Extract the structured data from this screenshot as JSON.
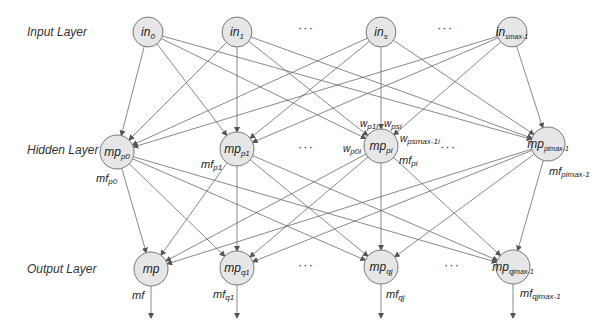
{
  "diagram": {
    "type": "neural-network",
    "colors": {
      "node_fill": "#e6e6e6",
      "node_stroke": "#777777",
      "edge": "#666666",
      "text": "#222222"
    },
    "layers": [
      {
        "label": "Input Layer",
        "y": 32
      },
      {
        "label": "Hidden Layer",
        "y": 148
      },
      {
        "label": "Output Layer",
        "y": 268
      }
    ],
    "ellipsis": "···",
    "input_nodes": [
      {
        "id": "in0",
        "base": "in",
        "sub": "0",
        "x": 148,
        "y": 32
      },
      {
        "id": "in1",
        "base": "in",
        "sub": "1",
        "x": 237,
        "y": 32
      },
      {
        "id": "ins",
        "base": "in",
        "sub": "s",
        "x": 381,
        "y": 32
      },
      {
        "id": "insmax",
        "base": "in",
        "sub": "smax-1",
        "x": 512,
        "y": 32
      }
    ],
    "hidden_nodes": [
      {
        "id": "mpp0",
        "base": "mp",
        "sub": "p0",
        "x": 117,
        "y": 152,
        "out_label": "mf",
        "out_sub": "p0"
      },
      {
        "id": "mpp1",
        "base": "mp",
        "sub": "p1",
        "x": 237,
        "y": 149,
        "out_label": "mf",
        "out_sub": "p1"
      },
      {
        "id": "mppi",
        "base": "mp",
        "sub": "pi",
        "x": 381,
        "y": 146,
        "out_label": "mf",
        "out_sub": "pi"
      },
      {
        "id": "mppimax",
        "base": "mp",
        "sub": "pimax-1",
        "x": 548,
        "y": 144,
        "out_label": "mf",
        "out_sub": "pimax-1"
      }
    ],
    "output_nodes": [
      {
        "id": "mp",
        "base": "mp",
        "sub": "",
        "x": 151,
        "y": 269,
        "out_label": "mf",
        "out_sub": ""
      },
      {
        "id": "mpq1",
        "base": "mp",
        "sub": "q1",
        "x": 237,
        "y": 268,
        "out_label": "mf",
        "out_sub": "q1"
      },
      {
        "id": "mpqj",
        "base": "mp",
        "sub": "qj",
        "x": 381,
        "y": 267,
        "out_label": "mf",
        "out_sub": "qj"
      },
      {
        "id": "mpqjmax",
        "base": "mp",
        "sub": "qjmax-1",
        "x": 513,
        "y": 267,
        "out_label": "mf",
        "out_sub": "qjmax-1"
      }
    ],
    "weight_labels": [
      {
        "base": "w",
        "sub": "p1i"
      },
      {
        "base": "w",
        "sub": "psi"
      },
      {
        "base": "w",
        "sub": "p0i"
      },
      {
        "base": "w",
        "sub": "psmax-1i"
      }
    ]
  }
}
